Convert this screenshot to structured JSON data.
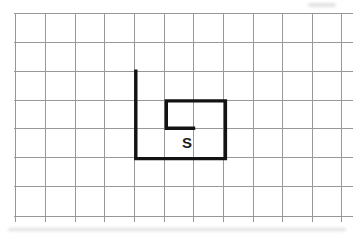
{
  "figure": {
    "type": "grid-diagram",
    "grid": {
      "columns": 11,
      "rows": 7,
      "line_color": "#98989b",
      "line_width": 1,
      "v_line_xs": [
        15.8,
        45.4,
        75.1,
        104.7,
        134.4,
        164.0,
        193.7,
        223.3,
        253.0,
        282.6,
        312.3,
        341.9
      ],
      "h_line_ys": [
        13.2,
        42.2,
        71.0,
        100.0,
        128.8,
        157.8,
        186.8,
        216.0
      ],
      "v_line_y_extent": [
        13.2,
        222.0
      ],
      "h_line_x_extent": [
        13.8,
        352.5
      ]
    },
    "path": {
      "color": "#131313",
      "width": 3.4,
      "points": [
        [
          135.8,
          69.6
        ],
        [
          135.8,
          158.6
        ],
        [
          225.4,
          158.6
        ],
        [
          225.4,
          100.9
        ],
        [
          166.3,
          100.9
        ],
        [
          166.3,
          128.2
        ],
        [
          195.2,
          128.2
        ]
      ],
      "grid_moves": [
        "down 3",
        "right 3",
        "up 2",
        "left 2",
        "down 1",
        "right 1"
      ]
    },
    "label": {
      "text": "S",
      "x": 187.0,
      "y": 147.5,
      "font_size": 15,
      "color": "#1c1c1c"
    }
  }
}
